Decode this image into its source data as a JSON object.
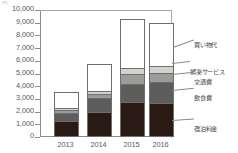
{
  "chart_data": {
    "type": "bar",
    "subtype": "stacked-bar",
    "title": "",
    "unit_note": "(円)",
    "xlabel": "",
    "ylabel": "",
    "categories": [
      "2013",
      "2014",
      "2015",
      "2016"
    ],
    "ylim": [
      0,
      10000
    ],
    "ytick_step": 1000,
    "ytick_labels": [
      "10,000",
      "9,000",
      "8,000",
      "7,000",
      "6,000",
      "5,000",
      "4,000",
      "3,000",
      "2,000",
      "1,000",
      "0"
    ],
    "ytick_values": [
      10000,
      9000,
      8000,
      7000,
      6000,
      5000,
      4000,
      3000,
      2000,
      1000,
      0
    ],
    "grid": false,
    "legend_position": "right-callouts",
    "stack_order_bottom_to_top": [
      "宿泊料金",
      "飲食費",
      "交通費",
      "娯楽サービス",
      "買い物代"
    ],
    "series": [
      {
        "name": "宿泊料金",
        "color": "#2a1a14",
        "values": [
          1100,
          1800,
          2600,
          2500
        ]
      },
      {
        "name": "飲食費",
        "color": "#5d5d5b",
        "values": [
          600,
          1100,
          1450,
          1700
        ]
      },
      {
        "name": "交通費",
        "color": "#9b9b99",
        "values": [
          250,
          300,
          750,
          700
        ]
      },
      {
        "name": "娯楽サービス",
        "color": "#d2d2cf",
        "values": [
          150,
          250,
          500,
          550
        ]
      },
      {
        "name": "買い物代",
        "color": "#ffffff",
        "values": [
          1300,
          2150,
          3850,
          3350
        ]
      }
    ],
    "totals": [
      3400,
      5600,
      9150,
      8800
    ]
  },
  "legend": {
    "items": [
      {
        "label": "買い物代"
      },
      {
        "label": "娯楽サービス"
      },
      {
        "label": "交通費"
      },
      {
        "label": "飲食費"
      },
      {
        "label": "宿泊料金"
      }
    ]
  }
}
